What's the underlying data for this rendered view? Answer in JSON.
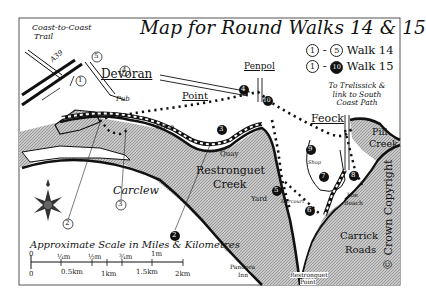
{
  "map": {
    "title": "Map for Round Walks 14 & 15",
    "legend": [
      {
        "from": "1",
        "to": "5",
        "label": "Walk 14",
        "to_style": "outline"
      },
      {
        "from": "1",
        "to": "10",
        "label": "Walk 15",
        "to_style": "filled"
      }
    ],
    "places": {
      "devoran": "Devoran",
      "penpol": "Penpol",
      "point": "Point",
      "feock": "Feock",
      "carclew": "Carclew",
      "restronguet_creek_1": "Restronguet",
      "restronguet_creek_2": "Creek",
      "pill_creek_1": "Pill",
      "pill_creek_2": "Creek",
      "carrick_roads_1": "Carrick",
      "carrick_roads_2": "Roads"
    },
    "small_labels": {
      "coast_to_coast_1": "Coast-to-Coast",
      "coast_to_coast_2": "Trail",
      "road": "A39",
      "pub": "Pub",
      "mine": "Mine",
      "quay": "Quay",
      "yard": "Yard",
      "harcourt": "Harcourt",
      "shop": "Shop",
      "loe_beach_1": "Loe",
      "loe_beach_2": "Beach",
      "pandora_inn_1": "Pandora",
      "pandora_inn_2": "Inn",
      "restronguet_point_1": "Restronguet",
      "restronguet_point_2": "Point",
      "trelissick_1": "To Trelissick &",
      "trelissick_2": "link to South",
      "trelissick_3": "Coast Path"
    },
    "waypoints_walk14": [
      "1",
      "2",
      "3",
      "4",
      "5"
    ],
    "waypoints_walk15": [
      "2",
      "3",
      "4",
      "5",
      "6",
      "7",
      "8",
      "9",
      "10"
    ],
    "scale": {
      "title": "Approximate Scale in Miles & Kilometres",
      "miles": [
        "0",
        "¼m",
        "½m",
        "¾m",
        "1m"
      ],
      "km": [
        "0",
        "0.5km",
        "1km",
        "1.5km",
        "2km"
      ]
    },
    "copyright": "© Crown Copyright",
    "colors": {
      "water": "#b8b8b8",
      "ink": "#111111",
      "paper": "#ffffff"
    }
  }
}
